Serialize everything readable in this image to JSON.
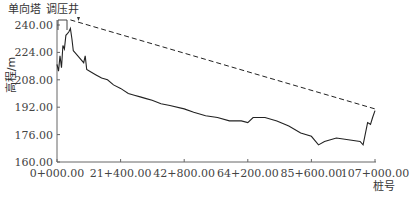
{
  "chart_data": {
    "type": "line",
    "title": "",
    "xlabel": "桩号",
    "ylabel": "高程/m",
    "ylim": [
      160,
      240
    ],
    "xlim": [
      0,
      107000
    ],
    "grid": false,
    "y_ticks": [
      "160.00",
      "176.00",
      "192.00",
      "208.00",
      "224.00",
      "240.00"
    ],
    "x_ticks": [
      "0+000.00",
      "21+400.00",
      "42+800.00",
      "64+200.00",
      "85+600.00",
      "107+000.00"
    ],
    "annotations": [
      {
        "text": "单向塔",
        "x": 800,
        "y": 240
      },
      {
        "text": "调压井",
        "x": 4500,
        "y": 243
      }
    ],
    "series": [
      {
        "name": "地面高程线",
        "style": "solid",
        "points": [
          [
            0,
            217
          ],
          [
            500,
            213
          ],
          [
            1000,
            222
          ],
          [
            1500,
            215
          ],
          [
            2000,
            228
          ],
          [
            2500,
            226
          ],
          [
            3000,
            234
          ],
          [
            3500,
            235
          ],
          [
            4000,
            236
          ],
          [
            4500,
            238
          ],
          [
            5000,
            232
          ],
          [
            5500,
            225
          ],
          [
            6000,
            224
          ],
          [
            7000,
            222
          ],
          [
            8000,
            220
          ],
          [
            9000,
            218
          ],
          [
            9500,
            222
          ],
          [
            10000,
            214
          ],
          [
            11000,
            213
          ],
          [
            13000,
            211
          ],
          [
            15000,
            209
          ],
          [
            17000,
            208
          ],
          [
            19000,
            205
          ],
          [
            21400,
            203
          ],
          [
            24000,
            200
          ],
          [
            26000,
            199
          ],
          [
            28000,
            198
          ],
          [
            30000,
            197
          ],
          [
            32000,
            196
          ],
          [
            35000,
            194
          ],
          [
            38000,
            193
          ],
          [
            42800,
            191
          ],
          [
            46000,
            189
          ],
          [
            50000,
            187
          ],
          [
            54000,
            186
          ],
          [
            58000,
            184
          ],
          [
            62000,
            184
          ],
          [
            64200,
            183
          ],
          [
            66000,
            186
          ],
          [
            70000,
            186
          ],
          [
            74000,
            184
          ],
          [
            78000,
            181
          ],
          [
            82000,
            177
          ],
          [
            85600,
            175
          ],
          [
            88000,
            170
          ],
          [
            90000,
            172
          ],
          [
            94000,
            174
          ],
          [
            98000,
            173
          ],
          [
            102000,
            172
          ],
          [
            103000,
            170
          ],
          [
            104500,
            183
          ],
          [
            105500,
            182
          ],
          [
            106200,
            186
          ],
          [
            107000,
            190
          ]
        ]
      },
      {
        "name": "压力线",
        "style": "dashed",
        "points": [
          [
            4500,
            243
          ],
          [
            107000,
            191
          ]
        ]
      }
    ]
  }
}
